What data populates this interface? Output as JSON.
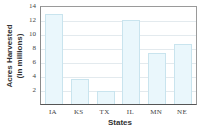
{
  "chart_data": {
    "type": "bar",
    "title": "",
    "xlabel": "States",
    "ylabel": "Acres Harvested (in millions)",
    "ylabel_lines": [
      "Acres Harvested",
      "(in millions)"
    ],
    "categories": [
      "IA",
      "KS",
      "TX",
      "IL",
      "MN",
      "NE"
    ],
    "values": [
      12.9,
      3.6,
      1.9,
      12.0,
      7.3,
      8.6
    ],
    "ylim": [
      0,
      14
    ],
    "yticks": [
      2,
      4,
      6,
      8,
      10,
      12,
      14
    ],
    "grid": true,
    "legend": null,
    "colors": {
      "bar_fill": "#eaf7fc",
      "bar_edge": "#c9e4ee",
      "grid": "#e3eaee",
      "axis": "#555555"
    }
  }
}
